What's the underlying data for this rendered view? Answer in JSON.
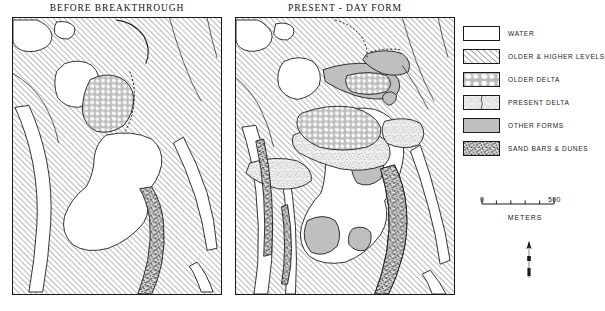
{
  "figure": {
    "kind": "two-panel geomorphological map",
    "width": 605,
    "height": 311,
    "background_color": "#ffffff",
    "ink_color": "#1a1a1a"
  },
  "panels": [
    {
      "id": "left",
      "title": "BEFORE  BREAKTHROUGH"
    },
    {
      "id": "right",
      "title": "PRESENT - DAY  FORM"
    }
  ],
  "legend": {
    "items": [
      {
        "key": "water",
        "label": "WATER",
        "fill": "#ffffff",
        "pattern": "solid-white"
      },
      {
        "key": "older_levels",
        "label": "OLDER & HIGHER  LEVELS",
        "fill": "#f2f2f2",
        "pattern": "diagonal-hatch"
      },
      {
        "key": "older_delta",
        "label": "OLDER  DELTA",
        "fill": "#c9c9c9",
        "pattern": "cellular-mosaic"
      },
      {
        "key": "present_delta",
        "label": "PRESENT  DELTA",
        "fill": "#ededed",
        "pattern": "fine-stipple"
      },
      {
        "key": "other_forms",
        "label": "OTHER  FORMS",
        "fill": "#bfbfbf",
        "pattern": "solid-grey"
      },
      {
        "key": "sand_bars",
        "label": "SAND BARS & DUNES",
        "fill": "#d8d8d8",
        "pattern": "coarse-stipple"
      }
    ]
  },
  "scale": {
    "min_label": "0",
    "max_label": "500",
    "units_label": "METERS",
    "segments": 5,
    "min_value": 0,
    "max_value": 500
  },
  "north_arrow": {
    "name": "north-arrow",
    "orientation": "up"
  }
}
